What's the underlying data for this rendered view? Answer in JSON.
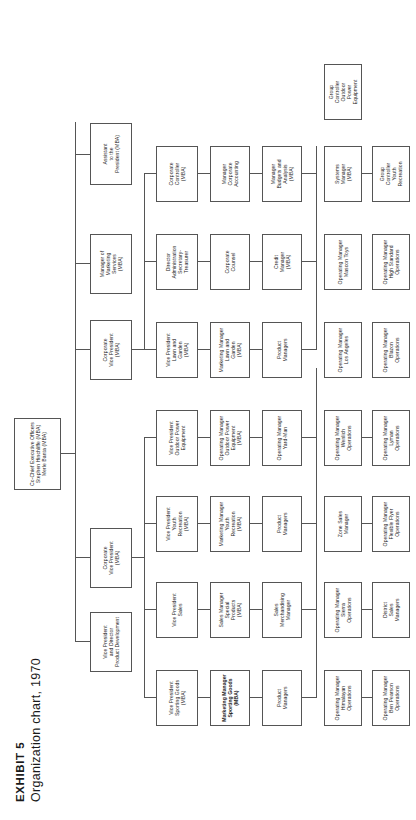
{
  "exhibit": {
    "label": "EXHIBIT 5",
    "caption": "Organization chart, 1970"
  },
  "chart_data": {
    "type": "diagram",
    "title": "Organization chart, 1970",
    "orientation": "rotated-90",
    "nodes": {
      "ceo": "Co-Chief Executive Officers\nStephen Hinchliffe (MBA)\nMerle Banta (MBA)",
      "vp_product_dev": "Vice President\nand Director\nProduct Development",
      "corporate_vp_left": "Corporate\nVice President\n(MBA)",
      "corporate_vp_right": "Corporate\nVice President\n(MBA)",
      "mgr_marketing_services": "Manager of\nMarketing\nServices\n(MBA)",
      "assistant_president": "Assistant\nto the\nPresident (MBA)",
      "vp_sporting_goods": "Vice President\nSporting Goods\n(MBA)",
      "vp_sales": "Vice President\nSales",
      "vp_youth_recreation": "Vice President\nYouth\nRecreation\n(MBA)",
      "vp_outdoor_power": "Vice President\nOutdoor Power\nEquipment",
      "vp_lawn_garden": "Vice President\nLawn and\nGarden\n(MBA)",
      "director_administration": "Director\nAdministration\nSecretary-\nTreasurer",
      "corporate_controller": "Corporate\nController\n(MBA)",
      "mm_sporting_goods": "Marketing Manager\nSporting Goods\n(MBA)",
      "sales_mgr_special_products": "Sales Manager\nSpecial\nProducts\n(MBA)",
      "mm_youth_recreation": "Marketing Manager\nYouth\nRecreation\n(MBA)",
      "om_outdoor_power": "Operating Manager\nOutdoor Power\nEquipment\n(MBA)",
      "mm_lawn_garden": "Marketing Manager\nLawn and\nGarden\n(MBA)",
      "corporate_counsel": "Corporate\nCounsel",
      "mgr_corporate_accounting": "Manager\nCorporate\nAccounting",
      "product_managers_sg": "Product\nManagers",
      "sales_merchandising_manager": "Sales\nMerchandising\nManager",
      "product_managers_yr": "Product\nManagers",
      "om_yard_man": "Operating Manager\nYard-Man",
      "product_managers_lg": "Product\nManagers",
      "credit_manager": "Credit\nManager\n(MBA)",
      "mgr_budgets_analysis": "Manager\nBudgets and\nAnalysis\n(MBA)",
      "om_sierra": "Operating Manager\nSierra\nOperations",
      "zone_sales_manager": "Zone Sales\nManager",
      "om_wenlich": "Operating Manager\nWenlich\nOperations",
      "om_los_angeles": "Operating Manager\nLos Angeles",
      "systems_manager": "Systems\nManager\n(MBA)",
      "om_ben_pearson": "Operating Manager\nBen Pearson\nOperations",
      "district_sales_managers": "District\nSales\nManagers",
      "om_flexible_flyer": "Operating Manager\nFlexible Flyer\nOperations",
      "group_controller_youth": "Group\nController\nYouth\nRecreation",
      "om_lyman": "Operating Manager\nLyman\nOperations",
      "om_blazon": "Operating Manager\nBlazon\nOperations",
      "om_mascon_toys": "Operating Manager\nMascon Toys",
      "group_controller_outdoor": "Group\nController\nOutdoor\nPower\nEquipment",
      "om_high_standard": "Operating Manager\nHigh Standard\nOperations",
      "om_himalayan": "Operating Manager\nHimalayan\nOperations"
    }
  }
}
